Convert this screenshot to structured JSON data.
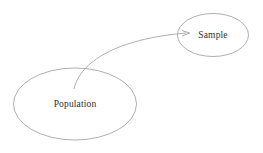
{
  "diagram": {
    "background_color": "#ffffff",
    "stroke_color": "#9b9b9b",
    "text_color": "#2e2e2e",
    "nodes": [
      {
        "id": "population",
        "label": "Population",
        "shape": "ellipse",
        "cx": 75,
        "cy": 104,
        "rx": 61.5,
        "ry": 36
      },
      {
        "id": "sample",
        "label": "Sample",
        "shape": "ellipse",
        "cx": 213,
        "cy": 35,
        "rx": 35.5,
        "ry": 21.5
      }
    ],
    "edges": [
      {
        "id": "population-to-sample",
        "from": "population",
        "to": "sample",
        "style": "curved-arrow",
        "path": "M 74 89 C 82 60, 118 38, 186 33",
        "arrowhead": "open-right"
      }
    ]
  }
}
